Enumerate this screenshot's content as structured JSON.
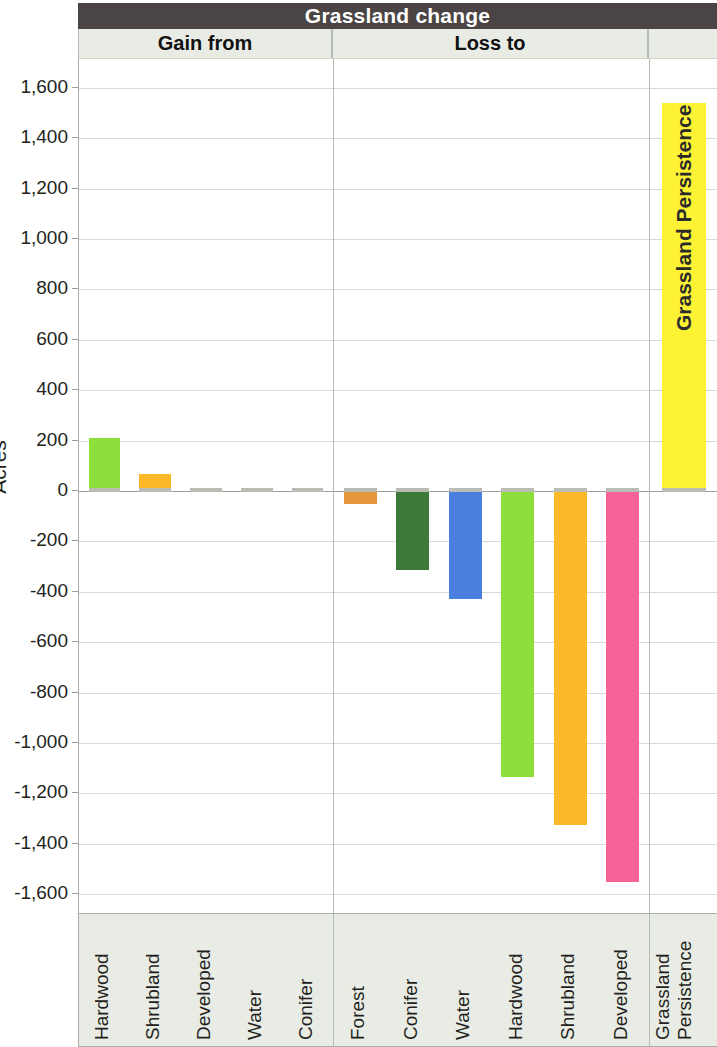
{
  "header": {
    "title": "Grassland change",
    "panels": [
      {
        "key": "gain",
        "label": "Gain from"
      },
      {
        "key": "loss",
        "label": "Loss to"
      },
      {
        "key": "pers",
        "label": ""
      }
    ]
  },
  "axis": {
    "y_title": "Acres",
    "ticks": [
      "1,600",
      "1,400",
      "1,200",
      "1,000",
      "800",
      "600",
      "400",
      "200",
      "0",
      "-200",
      "-400",
      "-600",
      "-800",
      "-1,000",
      "-1,200",
      "-1,400",
      "-1,600"
    ]
  },
  "persistence_bar_label": "Grassland Persistence",
  "persistence_axis_label": {
    "line1": "Grassland",
    "line2": "Persistence"
  },
  "colors": {
    "title_bar": "#4a4544",
    "panel_header": "#e9ece5",
    "hardwood": "#8ede3c",
    "shrubland": "#fcb826",
    "developed": "#f7629a",
    "water": "#4a7fe0",
    "conifer": "#3d7a3a",
    "forest": "#e8963c",
    "persistence": "#fdf334"
  },
  "chart_data": {
    "type": "bar",
    "title": "Grassland change",
    "xlabel": "",
    "ylabel": "Acres",
    "ylim": [
      -1600,
      1600
    ],
    "grid": true,
    "legend": "none",
    "panels": [
      {
        "name": "Gain from",
        "categories": [
          "Hardwood",
          "Shrubland",
          "Developed",
          "Water",
          "Conifer"
        ],
        "values": [
          210,
          68,
          5,
          1,
          1
        ],
        "colors": [
          "#8ede3c",
          "#fcb826",
          "#f7629a",
          "#4a7fe0",
          "#3d7a3a"
        ]
      },
      {
        "name": "Loss to",
        "categories": [
          "Forest",
          "Conifer",
          "Water",
          "Hardwood",
          "Shrubland",
          "Developed"
        ],
        "values": [
          -50,
          -315,
          -428,
          -1135,
          -1325,
          -1550
        ],
        "colors": [
          "#e8963c",
          "#3d7a3a",
          "#4a7fe0",
          "#8ede3c",
          "#fcb826",
          "#f7629a"
        ]
      },
      {
        "name": "",
        "categories": [
          "Grassland Persistence"
        ],
        "values": [
          1540
        ],
        "colors": [
          "#fdf334"
        ]
      }
    ]
  }
}
